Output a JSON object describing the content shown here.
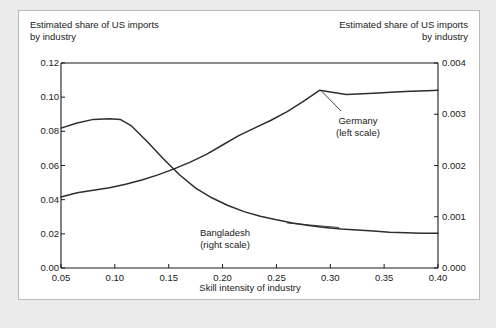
{
  "figure": {
    "left_axis_title": "Estimated share of US imports\nby industry",
    "right_axis_title": "Estimated share of US imports\nby industry",
    "xlabel": "Skill intensity of industry",
    "line_color": "#2e2e2e",
    "panel_background": "#ffffff",
    "page_background": "#ebebeb",
    "border_color": "#b9b9b9"
  },
  "chart_data": {
    "type": "line",
    "title": "",
    "subtitle": "",
    "xlabel": "Skill intensity of industry",
    "ylabel": "Estimated share of US imports by industry",
    "ylabel_right": "Estimated share of US imports by industry",
    "xlim": [
      0.05,
      0.4
    ],
    "ylim": [
      0.0,
      0.12
    ],
    "ylim_right": [
      0.0,
      0.004
    ],
    "xticks": [
      "0.05",
      "0.10",
      "0.15",
      "0.20",
      "0.25",
      "0.30",
      "0.35",
      "0.40"
    ],
    "xtick_values": [
      0.05,
      0.1,
      0.15,
      0.2,
      0.25,
      0.3,
      0.35,
      0.4
    ],
    "yticks_left": [
      "0.00",
      "0.02",
      "0.04",
      "0.06",
      "0.08",
      "0.10",
      "0.12"
    ],
    "ytick_values_left": [
      0.0,
      0.02,
      0.04,
      0.06,
      0.08,
      0.1,
      0.12
    ],
    "yticks_right": [
      "0.000",
      "0.001",
      "0.002",
      "0.003",
      "0.004"
    ],
    "ytick_values_right": [
      0.0,
      0.001,
      0.002,
      0.003,
      0.004
    ],
    "grid": false,
    "legend": "annotations",
    "series": [
      {
        "name": "Germany",
        "axis": "left",
        "annotation": "Germany\n(left scale)",
        "x": [
          0.05,
          0.065,
          0.08,
          0.095,
          0.11,
          0.125,
          0.14,
          0.155,
          0.17,
          0.185,
          0.2,
          0.215,
          0.23,
          0.245,
          0.26,
          0.275,
          0.29,
          0.3,
          0.315,
          0.33,
          0.345,
          0.36,
          0.375,
          0.39,
          0.4
        ],
        "values": [
          0.0415,
          0.044,
          0.0455,
          0.047,
          0.049,
          0.0515,
          0.0545,
          0.058,
          0.062,
          0.0665,
          0.072,
          0.0775,
          0.082,
          0.0865,
          0.0915,
          0.0975,
          0.104,
          0.103,
          0.1015,
          0.102,
          0.1025,
          0.103,
          0.1035,
          0.1038,
          0.104
        ]
      },
      {
        "name": "Bangladesh",
        "axis": "right",
        "annotation": "Bangladesh\n(right scale)",
        "x": [
          0.05,
          0.065,
          0.08,
          0.095,
          0.105,
          0.115,
          0.13,
          0.145,
          0.16,
          0.175,
          0.19,
          0.205,
          0.22,
          0.235,
          0.25,
          0.265,
          0.28,
          0.295,
          0.31,
          0.325,
          0.34,
          0.355,
          0.37,
          0.385,
          0.4
        ],
        "values": [
          0.00273,
          0.00283,
          0.0029,
          0.00291,
          0.0029,
          0.00278,
          0.00247,
          0.00213,
          0.00182,
          0.00156,
          0.00137,
          0.00122,
          0.0011,
          0.00101,
          0.00094,
          0.00088,
          0.00083,
          0.00079,
          0.00076,
          0.00074,
          0.00072,
          0.0007,
          0.00069,
          0.00068,
          0.00068
        ]
      }
    ]
  }
}
